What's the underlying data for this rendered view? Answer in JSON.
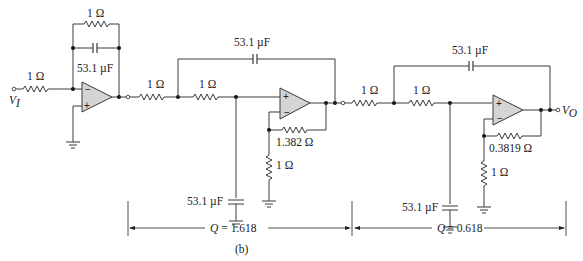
{
  "figure": {
    "caption": "(b)",
    "input_label": "V",
    "input_sub": "I",
    "output_label": "V",
    "output_sub": "O"
  },
  "stage1": {
    "name": "Inverting integrator / first-order section",
    "input_resistor": "1 Ω",
    "feedback_resistor": "1 Ω",
    "feedback_capacitor": "53.1 µF",
    "opamp_inv": "−",
    "opamp_noninv": "+"
  },
  "stage2": {
    "name": "Sallen-Key section",
    "r1": "1 Ω",
    "r2": "1 Ω",
    "c_feedback": "53.1 µF",
    "c_ground": "53.1 µF",
    "rf": "1.382 Ω",
    "rg": "1 Ω",
    "opamp_inv": "−",
    "opamp_noninv": "+",
    "q_label": "Q = 1.618",
    "q_symbol": "Q",
    "q_value": "= 1.618"
  },
  "stage3": {
    "name": "Sallen-Key section",
    "r1": "1 Ω",
    "r2": "1 Ω",
    "c_feedback": "53.1 µF",
    "c_ground": "53.1 µF",
    "rf": "0.3819 Ω",
    "rg": "1 Ω",
    "opamp_inv": "−",
    "opamp_noninv": "+",
    "q_label": "Q = 0.618",
    "q_symbol": "Q",
    "q_value": "= 0.618"
  }
}
